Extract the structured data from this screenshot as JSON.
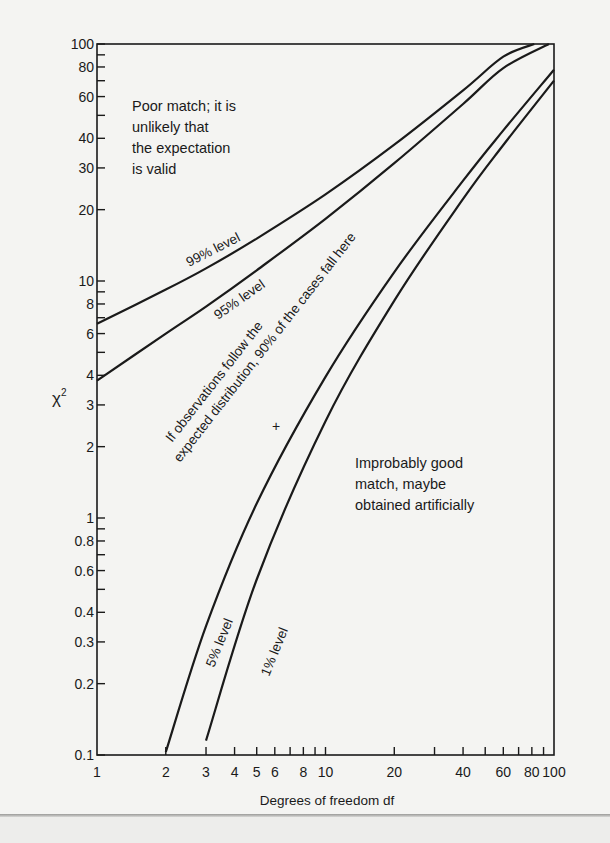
{
  "chart_data": {
    "type": "line",
    "title": "",
    "xlabel": "Degrees of freedom df",
    "ylabel": "χ²",
    "xscale": "log",
    "yscale": "log",
    "xlim": [
      1,
      100
    ],
    "ylim": [
      0.1,
      100
    ],
    "grid": false,
    "x_ticks_labeled": [
      1,
      2,
      3,
      4,
      5,
      6,
      8,
      10,
      20,
      40,
      60,
      80,
      100
    ],
    "x_tick_labels": [
      "1",
      "2",
      "3",
      "4",
      "5",
      "6",
      "8",
      "10",
      "20",
      "40",
      "60",
      "80",
      "100"
    ],
    "x_ticks_minor": [
      7,
      9,
      30,
      50,
      70,
      90
    ],
    "y_ticks_labeled": [
      0.1,
      0.2,
      0.3,
      0.4,
      0.6,
      0.8,
      1,
      2,
      3,
      4,
      6,
      8,
      10,
      20,
      30,
      40,
      60,
      80,
      100
    ],
    "y_tick_labels": [
      "0.1",
      "0.2",
      "0.3",
      "0.4",
      "0.6",
      "0.8",
      "1",
      "2",
      "3",
      "4",
      "6",
      "8",
      "10",
      "20",
      "30",
      "40",
      "60",
      "80",
      "100"
    ],
    "y_ticks_minor": [
      0.5,
      0.7,
      0.9,
      5,
      7,
      9,
      50,
      70,
      90
    ],
    "series": [
      {
        "name": "99% level",
        "x": [
          1,
          2,
          3,
          5,
          10,
          20,
          40,
          60,
          82
        ],
        "values": [
          6.6,
          9.2,
          11.3,
          15.1,
          23.2,
          37.6,
          63.7,
          88.4,
          100
        ]
      },
      {
        "name": "95% level",
        "x": [
          1,
          2,
          3,
          5,
          10,
          20,
          40,
          60,
          95
        ],
        "values": [
          3.8,
          6.0,
          7.8,
          11.1,
          18.3,
          31.4,
          55.8,
          79.1,
          100
        ]
      },
      {
        "name": "5% level",
        "x": [
          2,
          3,
          5,
          10,
          20,
          40,
          60,
          100
        ],
        "values": [
          0.103,
          0.35,
          1.15,
          3.94,
          10.9,
          26.5,
          43.2,
          77.9
        ]
      },
      {
        "name": "1% level",
        "x": [
          3,
          5,
          10,
          20,
          40,
          60,
          100
        ],
        "values": [
          0.115,
          0.55,
          2.56,
          8.26,
          22.2,
          37.5,
          70.1
        ]
      }
    ],
    "annotations": [
      {
        "text": "Poor match; it is unlikely that the expectation is valid",
        "region": "above 99% level"
      },
      {
        "text": "If observations follow the expected distribution, 90% of the cases fall here",
        "region": "between 95% and 5% levels"
      },
      {
        "text": "Improbably good match, maybe obtained artificially",
        "region": "below 1% level"
      },
      {
        "text": "+",
        "x": 6.5,
        "y": 2.4,
        "type": "marker"
      }
    ]
  },
  "labels": {
    "ylabel_base": "χ",
    "ylabel_sup": "2",
    "xlabel": "Degrees of freedom df",
    "curve_99": "99% level",
    "curve_95": "95% level",
    "curve_5": "5% level",
    "curve_1": "1% level",
    "poor_match": [
      "Poor match; it is",
      "unlikely that",
      "the expectation",
      "is valid"
    ],
    "middle_line1": "If observations follow the",
    "middle_line2": "expected distribution, 90% of the cases fall here",
    "good_match": [
      "Improbably good",
      "match, maybe",
      "obtained artificially"
    ],
    "marker": "+"
  },
  "colors": {
    "ink": "#1a1a1a",
    "paper": "#f4f4f2"
  }
}
